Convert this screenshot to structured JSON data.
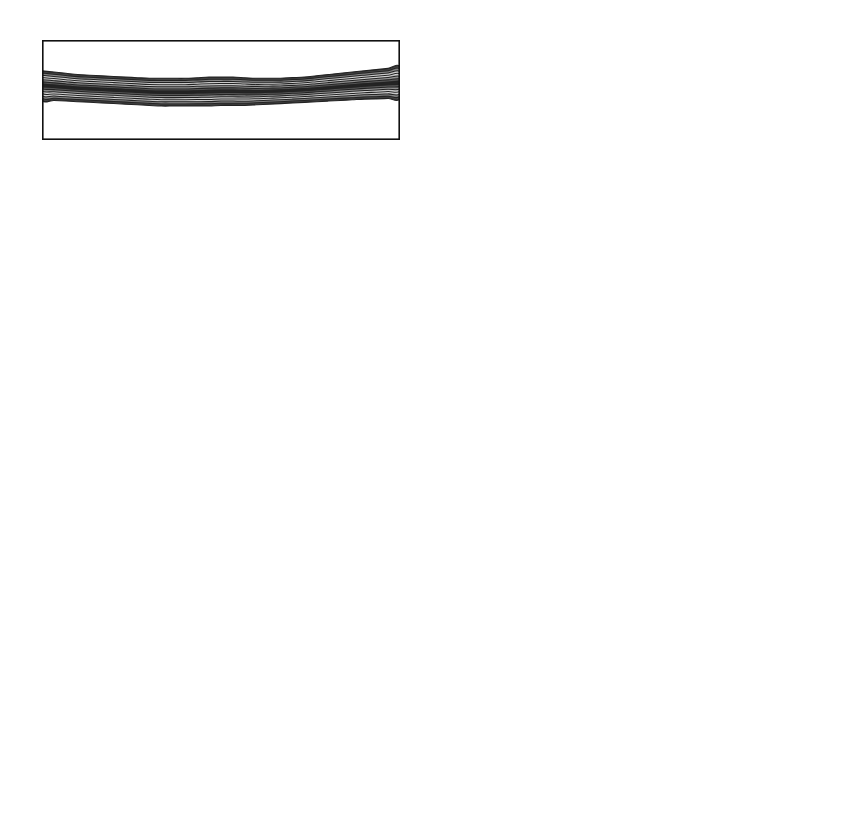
{
  "figure": {
    "kind": "multi-panel-scientific-figure",
    "rows": 6,
    "columns": 2,
    "left_column_type": "contour",
    "right_column_type": "line"
  },
  "axes": {
    "x_ticks": [
      "-15",
      "-10",
      "-5",
      "0",
      "5",
      "10",
      "15"
    ],
    "x_tick_values": [
      -15,
      -10,
      -5,
      0,
      5,
      10,
      15
    ],
    "x_range": [
      -15,
      15
    ],
    "left_y_ticks": [
      "-4",
      "-2",
      "0",
      "2",
      "4"
    ],
    "left_y_tick_values": [
      -4,
      -2,
      0,
      2,
      4
    ],
    "left_y_range": [
      -4,
      4
    ],
    "left_y_inverted": true,
    "right_y_ticks": [
      "10",
      "0",
      "-10"
    ],
    "right_y_tick_values": [
      10,
      0,
      -10
    ],
    "right_y_range": [
      -10,
      10
    ]
  },
  "colorbar": {
    "tick_labels": [
      "1",
      "40",
      "80",
      "120",
      "160",
      "200"
    ],
    "tick_values": [
      1,
      40,
      80,
      120,
      160,
      200
    ],
    "min": 1,
    "max": 200,
    "colormap": "dark-light-dark grayscale",
    "stops": [
      "#000000",
      "#2b2b2b",
      "#6f6f6f",
      "#b4b4b4",
      "#e4e4e4",
      "#f2f2f2",
      "#dcdcdc",
      "#a8a8a8",
      "#6a6a6a",
      "#2a2a2a",
      "#0c0c0c"
    ]
  },
  "panels": [
    {
      "time_label_prefix": "t",
      "time_label": " = 0 min",
      "time": 0.0
    },
    {
      "time_label_prefix": "t",
      "time_label": " = 4.5 min",
      "time": 4.5
    },
    {
      "time_label_prefix": "t",
      "time_label": " = 7.4 min",
      "time": 7.4
    },
    {
      "time_label_prefix": "t",
      "time_label": " = 10.4 min",
      "time": 10.4
    },
    {
      "time_label_prefix": "t",
      "time_label": " = 14.7 min",
      "time": 14.7
    },
    {
      "time_label_prefix": "t",
      "time_label": " = 19.8 min",
      "time": 19.8
    }
  ],
  "chart_data": {
    "type": "line",
    "title": "",
    "xlabel": "",
    "ylabel": "",
    "xlim": [
      -15,
      15
    ],
    "ylim": [
      -10,
      10
    ],
    "grid": false,
    "legend": "none",
    "x": [
      -15,
      -14,
      -13,
      -12,
      -11,
      -10,
      -9,
      -8,
      -7,
      -6,
      -5,
      -4,
      -3,
      -2,
      -1,
      0,
      1,
      2,
      3,
      4,
      5,
      6,
      7,
      8,
      9,
      10,
      11,
      12,
      13,
      14,
      15
    ],
    "series": [
      {
        "name": "t = 0 min",
        "values": [
          1.0,
          0.95,
          0.9,
          0.8,
          0.7,
          0.55,
          0.4,
          0.2,
          0.0,
          -0.3,
          -0.55,
          -0.75,
          -0.9,
          -1.0,
          -1.05,
          -1.0,
          -0.9,
          -0.8,
          -0.65,
          -0.5,
          -0.3,
          -0.1,
          0.1,
          0.3,
          0.45,
          0.6,
          0.7,
          0.8,
          0.9,
          0.95,
          1.0
        ]
      },
      {
        "name": "t = 4.5 min",
        "values": [
          0.0,
          0.8,
          1.5,
          2.0,
          2.4,
          2.7,
          2.7,
          2.5,
          2.0,
          1.4,
          0.8,
          0.2,
          -0.4,
          -0.9,
          -1.4,
          -1.8,
          -2.1,
          -2.4,
          -2.6,
          -2.7,
          -2.8,
          -2.8,
          -2.8,
          -2.7,
          -2.5,
          -2.2,
          -1.8,
          -1.3,
          -0.8,
          -0.3,
          0.3
        ]
      },
      {
        "name": "t = 7.4 min",
        "values": [
          -2.6,
          -3.0,
          -3.3,
          -3.5,
          -3.7,
          -3.85,
          -3.95,
          -4.0,
          -4.0,
          -3.95,
          -3.9,
          -3.8,
          -3.6,
          -3.3,
          -2.8,
          -2.1,
          -1.2,
          -0.1,
          1.2,
          2.5,
          3.6,
          4.4,
          4.8,
          4.7,
          4.2,
          3.4,
          2.4,
          1.4,
          0.5,
          -0.5,
          -1.9
        ]
      },
      {
        "name": "t = 10.4 min",
        "values": [
          -5.4,
          -4.4,
          -3.4,
          -2.4,
          -1.3,
          -0.1,
          1.3,
          2.9,
          4.6,
          6.2,
          7.3,
          7.6,
          7.4,
          6.8,
          5.8,
          4.5,
          3.3,
          2.0,
          0.6,
          -0.6,
          -1.6,
          -2.4,
          -3.0,
          -3.5,
          -3.9,
          -4.3,
          -4.6,
          -4.9,
          -5.1,
          -5.2,
          -5.1
        ]
      },
      {
        "name": "t = 14.7 min",
        "values": [
          -7.2,
          -7.3,
          -7.4,
          -7.45,
          -7.5,
          -7.5,
          -7.2,
          -6.0,
          -3.6,
          -0.8,
          1.5,
          2.9,
          3.5,
          3.6,
          3.5,
          3.2,
          2.9,
          2.6,
          2.3,
          2.2,
          2.2,
          2.4,
          2.9,
          3.4,
          3.5,
          3.2,
          2.4,
          1.0,
          -1.4,
          -3.6,
          -5.2
        ]
      },
      {
        "name": "t = 19.8 min",
        "values": [
          -2.0,
          -1.4,
          -1.6,
          -2.2,
          -2.8,
          -3.3,
          -3.7,
          -3.8,
          -3.2,
          -1.2,
          1.8,
          3.9,
          4.9,
          5.2,
          4.9,
          4.3,
          3.6,
          3.0,
          2.6,
          2.3,
          2.1,
          1.6,
          1.1,
          1.0,
          1.2,
          1.0,
          0.6,
          0.2,
          -0.4,
          -0.9,
          -1.2
        ]
      }
    ]
  },
  "contour_data": {
    "type": "contour",
    "xlim": [
      -15,
      15
    ],
    "ylim": [
      -4,
      4
    ],
    "y_inverted": true,
    "description": "grayscale contour plumes of a stratified layer deforming over time",
    "panels": [
      {
        "name": "t = 0 min",
        "layer_top": [
          -1.6,
          -1.5,
          -1.4,
          -1.3,
          -1.25,
          -1.2,
          -1.15,
          -1.1,
          -1.05,
          -1.0,
          -1.0,
          -1.0,
          -1.0,
          -1.05,
          -1.1,
          -1.1,
          -1.1,
          -1.05,
          -1.0,
          -1.0,
          -1.0,
          -1.05,
          -1.1,
          -1.2,
          -1.3,
          -1.4,
          -1.5,
          -1.6,
          -1.7,
          -1.8,
          -1.9
        ],
        "layer_bottom": [
          0.85,
          0.9,
          0.95,
          1.0,
          1.05,
          1.1,
          1.15,
          1.2,
          1.25,
          1.3,
          1.35,
          1.35,
          1.35,
          1.35,
          1.35,
          1.3,
          1.3,
          1.3,
          1.25,
          1.2,
          1.15,
          1.1,
          1.05,
          1.0,
          0.95,
          0.9,
          0.85,
          0.8,
          0.78,
          0.75,
          0.72
        ]
      },
      {
        "name": "t = 4.5 min",
        "layer_top": [
          -1.4,
          -1.5,
          -1.6,
          -1.7,
          -1.8,
          -1.85,
          -1.9,
          -1.85,
          -1.75,
          -1.6,
          -1.45,
          -1.35,
          -1.25,
          -1.2,
          -1.15,
          -1.1,
          -1.1,
          -1.05,
          -1.05,
          -1.0,
          -1.0,
          -1.05,
          -1.1,
          -1.2,
          -1.3,
          -1.45,
          -1.6,
          -1.8,
          -2.0,
          -2.2,
          -2.4
        ],
        "layer_bottom": [
          1.3,
          1.3,
          1.25,
          1.2,
          1.15,
          1.1,
          1.05,
          1.05,
          1.05,
          1.1,
          1.15,
          1.2,
          1.25,
          1.3,
          1.3,
          1.3,
          1.3,
          1.25,
          1.2,
          1.15,
          1.1,
          1.05,
          1.0,
          0.95,
          0.9,
          0.9,
          0.9,
          0.9,
          0.9,
          0.85,
          0.8
        ]
      },
      {
        "name": "t = 7.4 min",
        "layer_top": [
          -0.6,
          -0.6,
          -0.6,
          -0.6,
          -0.65,
          -0.7,
          -0.75,
          -0.85,
          -0.95,
          -1.0,
          -0.9,
          -0.85,
          -1.1,
          -1.35,
          -1.5,
          -1.7,
          -1.9,
          -2.05,
          -2.2,
          -2.3,
          -2.3,
          -2.25,
          -2.1,
          -1.8,
          -1.5,
          -1.2,
          -1.0,
          -0.85,
          -0.75,
          -0.7,
          -0.65
        ],
        "layer_bottom": [
          0.55,
          0.55,
          0.55,
          0.55,
          0.6,
          0.6,
          0.6,
          0.6,
          0.6,
          0.6,
          0.6,
          0.6,
          0.6,
          0.62,
          0.65,
          0.7,
          0.78,
          0.85,
          0.95,
          1.0,
          1.0,
          0.95,
          0.85,
          0.75,
          0.65,
          0.6,
          0.58,
          0.55,
          0.55,
          0.55,
          0.55
        ]
      },
      {
        "name": "t = 10.4 min",
        "layer_top": [
          -1.2,
          -1.6,
          -1.95,
          -2.15,
          -2.25,
          -2.25,
          -2.2,
          -2.0,
          -1.7,
          -1.4,
          -1.15,
          -0.95,
          -0.8,
          -0.7,
          -0.65,
          -0.6,
          -0.6,
          -0.58,
          -0.55,
          -0.55,
          -0.55,
          -0.55,
          -0.55,
          -0.55,
          -0.55,
          -0.6,
          -0.7,
          -0.85,
          -1.0,
          -1.1,
          -1.2
        ],
        "layer_bottom": [
          0.4,
          0.3,
          0.25,
          0.3,
          0.4,
          0.55,
          0.7,
          0.8,
          0.85,
          0.9,
          0.95,
          1.0,
          1.0,
          1.0,
          1.0,
          1.0,
          1.0,
          1.0,
          1.0,
          1.0,
          1.0,
          1.0,
          1.0,
          1.0,
          1.0,
          1.0,
          1.0,
          1.0,
          1.0,
          1.0,
          1.0
        ]
      },
      {
        "name": "t = 14.7 min",
        "layer_top": [
          -0.6,
          -0.6,
          -0.6,
          -0.6,
          -0.65,
          -0.8,
          -1.3,
          -2.0,
          -2.35,
          -2.45,
          -2.45,
          -2.4,
          -2.3,
          -2.2,
          -2.1,
          -2.0,
          -1.9,
          -1.8,
          -1.6,
          -1.35,
          -1.0,
          -0.75,
          -0.6,
          -0.55,
          -0.5,
          -0.5,
          -0.5,
          -0.5,
          -0.5,
          -0.5,
          -0.5
        ],
        "layer_bottom": [
          1.1,
          1.1,
          1.15,
          1.2,
          1.2,
          1.25,
          1.3,
          1.3,
          1.3,
          1.3,
          1.3,
          1.3,
          1.3,
          1.25,
          1.2,
          1.1,
          1.0,
          0.9,
          0.8,
          0.8,
          0.85,
          0.9,
          0.95,
          1.0,
          1.0,
          1.05,
          1.05,
          1.05,
          1.05,
          1.05,
          1.05
        ]
      },
      {
        "name": "t = 19.8 min",
        "layer_top": [
          -0.3,
          -0.35,
          -0.4,
          -0.5,
          -0.8,
          -1.4,
          -2.1,
          -2.4,
          -2.45,
          -2.4,
          -2.3,
          -2.2,
          -2.1,
          -2.0,
          -1.9,
          -1.8,
          -1.7,
          -1.6,
          -1.5,
          -1.4,
          -1.3,
          -1.2,
          -1.1,
          -1.0,
          -0.95,
          -0.9,
          -0.85,
          -0.8,
          -0.78,
          -0.75,
          -0.72
        ],
        "layer_bottom": [
          0.9,
          0.9,
          0.9,
          0.9,
          0.9,
          0.9,
          0.85,
          0.8,
          0.75,
          0.7,
          0.65,
          0.6,
          0.55,
          0.5,
          0.45,
          0.4,
          0.35,
          0.3,
          0.25,
          0.2,
          0.15,
          0.1,
          0.05,
          0.0,
          -0.05,
          -0.1,
          -0.15,
          -0.2,
          -0.25,
          -0.3,
          -0.35
        ]
      }
    ]
  }
}
